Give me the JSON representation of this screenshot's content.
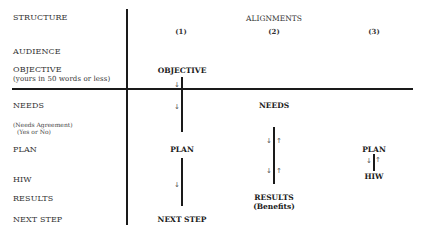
{
  "structure": {
    "heading": "STRUCTURE",
    "rows": [
      {
        "id": "audience",
        "label": "AUDIENCE"
      },
      {
        "id": "objective",
        "label": "OBJECTIVE",
        "sublabel": "(yours in 50 words or less)"
      },
      {
        "id": "needs",
        "label": "NEEDS"
      },
      {
        "id": "needs-agreement",
        "label": "(Needs Agreement)",
        "sublabel": "(Yes or No)"
      },
      {
        "id": "plan",
        "label": "PLAN"
      },
      {
        "id": "hiw",
        "label": "HIW"
      },
      {
        "id": "results",
        "label": "RESULTS"
      },
      {
        "id": "next-step",
        "label": "NEXT STEP"
      }
    ]
  },
  "alignments": {
    "heading": "ALIGNMENTS",
    "columns": [
      {
        "number": "(1)",
        "nodes": [
          "OBJECTIVE",
          "PLAN",
          "NEXT STEP"
        ],
        "arrows": [
          "↓",
          "↓",
          "↓"
        ]
      },
      {
        "number": "(2)",
        "nodes": [
          "NEEDS",
          "RESULTS",
          "(Benefits)"
        ],
        "arrows_down": [
          "↓",
          "↓"
        ],
        "arrows_up": [
          "↑",
          "↑"
        ]
      },
      {
        "number": "(3)",
        "nodes": [
          "PLAN",
          "HIW"
        ],
        "arrow_down": "↓",
        "arrow_up": "↑"
      }
    ]
  }
}
